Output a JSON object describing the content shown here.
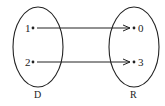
{
  "diagram": {
    "type": "mapping",
    "domain": {
      "label": "D",
      "elements": [
        "1",
        "2"
      ]
    },
    "range": {
      "label": "R",
      "elements": [
        "0",
        "3"
      ]
    },
    "arrows": [
      {
        "from": "1",
        "to": "0"
      },
      {
        "from": "2",
        "to": "3"
      }
    ],
    "colors": {
      "stroke": "#222222",
      "background": "#ffffff"
    }
  }
}
